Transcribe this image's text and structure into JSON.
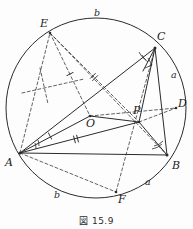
{
  "figure": {
    "caption": "図 15.9",
    "points": [
      {
        "id": "A",
        "label": "A",
        "x": 20,
        "y": 153,
        "lx": 5,
        "ly": 157
      },
      {
        "id": "B",
        "label": "B",
        "x": 167,
        "y": 155,
        "lx": 172,
        "ly": 160
      },
      {
        "id": "C",
        "label": "C",
        "x": 155,
        "y": 48,
        "lx": 157,
        "ly": 33
      },
      {
        "id": "D",
        "label": "D",
        "x": 176,
        "y": 108,
        "lx": 178,
        "ly": 100
      },
      {
        "id": "E",
        "label": "E",
        "x": 50,
        "y": 33,
        "lx": 41,
        "ly": 20
      },
      {
        "id": "F",
        "label": "F",
        "x": 116,
        "y": 192,
        "lx": 118,
        "ly": 196
      },
      {
        "id": "O",
        "label": "O",
        "x": 90,
        "y": 116,
        "lx": 89,
        "ly": 120
      },
      {
        "id": "P",
        "label": "P",
        "x": 139,
        "y": 122,
        "lx": 134,
        "ly": 108
      }
    ],
    "arc_labels": [
      {
        "id": "arc-top",
        "label": "b",
        "x": 96,
        "y": 12
      },
      {
        "id": "arc-right",
        "label": "a",
        "x": 172,
        "y": 73
      },
      {
        "id": "arc-bottom-left",
        "label": "b",
        "x": 55,
        "y": 193
      },
      {
        "id": "arc-bottom-right",
        "label": "a",
        "x": 146,
        "y": 180
      }
    ],
    "circle": {
      "cx": 96,
      "cy": 108,
      "r": 90
    },
    "colors": {
      "stroke": "#2b2b2b",
      "dashed": "#3a3a3a",
      "text": "#1b1b1b",
      "background": "#fdfdfd"
    },
    "solid_segments": [
      {
        "name": "chord-AB",
        "x1": 20,
        "y1": 153,
        "x2": 167,
        "y2": 155
      },
      {
        "name": "chord-AC",
        "x1": 20,
        "y1": 153,
        "x2": 155,
        "y2": 48
      },
      {
        "name": "chord-CB",
        "x1": 155,
        "y1": 48,
        "x2": 167,
        "y2": 155
      },
      {
        "name": "segment-AP",
        "x1": 20,
        "y1": 153,
        "x2": 139,
        "y2": 122
      },
      {
        "name": "segment-CP",
        "x1": 155,
        "y1": 48,
        "x2": 139,
        "y2": 122
      },
      {
        "name": "segment-PB",
        "x1": 139,
        "y1": 122,
        "x2": 167,
        "y2": 155
      },
      {
        "name": "segment-AO",
        "x1": 20,
        "y1": 153,
        "x2": 90,
        "y2": 116
      },
      {
        "name": "segment-OP",
        "x1": 90,
        "y1": 116,
        "x2": 139,
        "y2": 122
      }
    ],
    "dashed_segments": [
      {
        "name": "dashed-AE",
        "x1": 20,
        "y1": 153,
        "x2": 50,
        "y2": 33
      },
      {
        "name": "dashed-EO",
        "x1": 50,
        "y1": 33,
        "x2": 90,
        "y2": 116
      },
      {
        "name": "dashed-EP",
        "x1": 50,
        "y1": 33,
        "x2": 139,
        "y2": 122
      },
      {
        "name": "dashed-EB",
        "x1": 50,
        "y1": 33,
        "x2": 167,
        "y2": 155
      },
      {
        "name": "dashed-CF",
        "x1": 155,
        "y1": 48,
        "x2": 116,
        "y2": 192
      },
      {
        "name": "dashed-PD",
        "x1": 139,
        "y1": 122,
        "x2": 176,
        "y2": 108
      },
      {
        "name": "dashed-OD",
        "x1": 90,
        "y1": 116,
        "x2": 176,
        "y2": 108
      },
      {
        "name": "dashed-perp-left",
        "x1": 22,
        "y1": 93,
        "x2": 84,
        "y2": 79
      },
      {
        "name": "dashed-AF",
        "x1": 20,
        "y1": 153,
        "x2": 116,
        "y2": 192
      }
    ],
    "tick_marks": [
      {
        "name": "tick-single-AO",
        "x": 48,
        "y": 131,
        "angle": -28,
        "count": 1
      },
      {
        "name": "tick-double-AP",
        "x": 74,
        "y": 139,
        "angle": -15,
        "count": 2
      },
      {
        "name": "tick-single-EO",
        "x": 69,
        "y": 73,
        "angle": 64,
        "count": 1
      },
      {
        "name": "tick-double-EP",
        "x": 93,
        "y": 76,
        "angle": 45,
        "count": 2
      }
    ],
    "angle_arcs": [
      {
        "name": "angle-at-A",
        "vertex": "A",
        "radius": 16
      },
      {
        "name": "angle-at-C",
        "vertex": "C",
        "radius": 15
      },
      {
        "name": "angle-at-B",
        "vertex": "B",
        "radius": 15
      }
    ],
    "right_angle_marks": [
      {
        "name": "right-angle-at-C-foot",
        "x": 146,
        "y": 63
      }
    ]
  }
}
